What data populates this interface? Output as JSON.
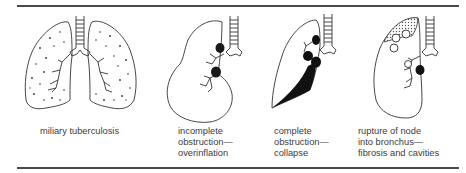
{
  "figure": {
    "panels": [
      {
        "id": "miliary",
        "caption": "miliary tuberculosis"
      },
      {
        "id": "overinflation",
        "caption": "incomplete\nobstruction—\noverinflation"
      },
      {
        "id": "collapse",
        "caption": "complete\nobstruction—\ncollapse"
      },
      {
        "id": "rupture",
        "caption": "rupture of node\ninto bronchus—\nfibrosis and cavities"
      }
    ]
  }
}
